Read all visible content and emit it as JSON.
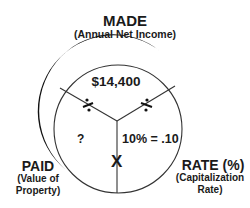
{
  "diagram": {
    "top": {
      "title": "MADE",
      "subtitle": "(Annual Net Income)",
      "value": "$14,400"
    },
    "left": {
      "title": "PAID",
      "subtitle_line1": "(Value of",
      "subtitle_line2": "Property)",
      "value": "?"
    },
    "right": {
      "title": "RATE (%)",
      "subtitle_line1": "(Capitalization",
      "subtitle_line2": "Rate)",
      "value": "10% = .10"
    },
    "operators": {
      "left_divider": "divide-icon",
      "right_divider": "divide-icon",
      "bottom": "X"
    },
    "colors": {
      "stroke": "#333333",
      "shadow": "#111111",
      "background": "#ffffff"
    }
  }
}
